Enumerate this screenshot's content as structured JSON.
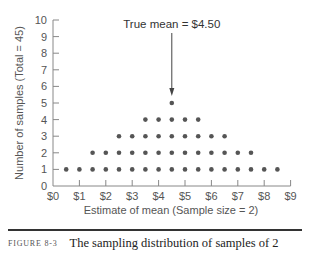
{
  "chart_data": {
    "type": "scatter",
    "subtype": "dot-plot",
    "title": "",
    "xlabel": "Estimate of mean (Sample size = 2)",
    "ylabel": "Number of samples (Total = 45)",
    "xlim": [
      0,
      9
    ],
    "ylim": [
      0,
      10
    ],
    "x_ticks": [
      "$0",
      "$1",
      "$2",
      "$3",
      "$4",
      "$5",
      "$6",
      "$7",
      "$8",
      "$9"
    ],
    "y_ticks": [
      "0",
      "1",
      "2",
      "3",
      "4",
      "5",
      "6",
      "7",
      "8",
      "9",
      "10"
    ],
    "grid": false,
    "x": [
      0.5,
      1.0,
      1.5,
      2.0,
      2.5,
      3.0,
      3.5,
      4.0,
      4.5,
      5.0,
      5.5,
      6.0,
      6.5,
      7.0,
      7.5,
      8.0,
      8.5
    ],
    "counts": [
      1,
      1,
      2,
      2,
      3,
      3,
      4,
      4,
      5,
      4,
      4,
      3,
      3,
      2,
      2,
      1,
      1
    ],
    "total": 45,
    "annotation": {
      "text": "True mean = $4.50",
      "x": 4.5
    },
    "dot_color": "#555555"
  },
  "caption": {
    "label": "FIGURE 8-3",
    "text": "The sampling distribution of samples of 2"
  }
}
